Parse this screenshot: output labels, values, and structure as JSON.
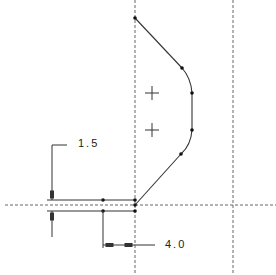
{
  "drawing": {
    "type": "2D sketch / technical drawing",
    "dimensions": [
      {
        "id": "dim-1",
        "value": "1.5",
        "orientation": "vertical"
      },
      {
        "id": "dim-2",
        "value": "4.0",
        "orientation": "horizontal"
      }
    ],
    "centerlines": {
      "vertical": [
        135,
        233
      ],
      "horizontal": [
        205
      ]
    },
    "profile_points": [
      [
        135,
        18
      ],
      [
        182,
        68
      ],
      [
        192,
        93
      ],
      [
        192,
        130
      ],
      [
        181,
        154
      ],
      [
        135,
        205
      ]
    ],
    "arc_centers": [
      [
        152,
        93
      ],
      [
        152,
        130
      ]
    ],
    "colors": {
      "line": "#333333",
      "centerline": "#666666",
      "background": "#ffffff"
    }
  }
}
